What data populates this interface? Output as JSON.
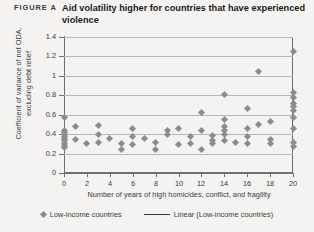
{
  "header": {
    "figure_tag": "FIGURE A",
    "title": "Aid volatility higher for countries that have experienced violence"
  },
  "legend": {
    "scatter_label": "Low-income countries",
    "scatter_marker": "diamond-marker-icon",
    "line_label": "Linear (Low-income countries)",
    "line_marker": "trend-line-icon"
  },
  "colors": {
    "marker": "#8d8b90",
    "trendline": "#3a3a3a",
    "grid": "#b9b7b4",
    "axis": "#6f6f6f",
    "background": "#f4f3f1"
  },
  "chart_data": {
    "type": "scatter",
    "title": "Aid volatility higher for countries that have experienced violence",
    "xlabel": "Number of years of high homicides, conflict, and fragility",
    "ylabel": "Coefficient of variance of net ODA, excluding debt relief",
    "xlim": [
      0,
      20
    ],
    "ylim": [
      0,
      1.4
    ],
    "xticks": [
      0,
      2,
      4,
      6,
      8,
      10,
      12,
      14,
      16,
      18,
      20
    ],
    "xtick_labels": [
      "0",
      "2",
      "4",
      "6",
      "8",
      "10",
      "12",
      "14",
      "16",
      "18",
      "20"
    ],
    "yticks": [
      0,
      0.2,
      0.4,
      0.6,
      0.8,
      1,
      1.2,
      1.4
    ],
    "ytick_labels": [
      "0",
      "0.2",
      "0.4",
      "0.6",
      "0.8",
      "1",
      "1.2",
      "1.4"
    ],
    "grid": "horizontal",
    "legend_position": "bottom",
    "series": [
      {
        "name": "Low-income countries",
        "type": "scatter",
        "marker": "diamond",
        "points": [
          [
            0,
            0.57
          ],
          [
            0,
            0.44
          ],
          [
            0,
            0.42
          ],
          [
            0,
            0.4
          ],
          [
            0,
            0.38
          ],
          [
            0,
            0.36
          ],
          [
            0,
            0.33
          ],
          [
            0,
            0.3
          ],
          [
            0,
            0.28
          ],
          [
            0,
            0.26
          ],
          [
            1,
            0.48
          ],
          [
            1,
            0.35
          ],
          [
            2,
            0.3
          ],
          [
            3,
            0.49
          ],
          [
            3,
            0.4
          ],
          [
            3,
            0.31
          ],
          [
            4,
            0.36
          ],
          [
            5,
            0.3
          ],
          [
            5,
            0.24
          ],
          [
            6,
            0.46
          ],
          [
            6,
            0.38
          ],
          [
            6,
            0.29
          ],
          [
            7,
            0.36
          ],
          [
            8,
            0.31
          ],
          [
            8,
            0.24
          ],
          [
            9,
            0.44
          ],
          [
            9,
            0.4
          ],
          [
            10,
            0.46
          ],
          [
            10,
            0.29
          ],
          [
            11,
            0.38
          ],
          [
            11,
            0.3
          ],
          [
            12,
            0.62
          ],
          [
            12,
            0.44
          ],
          [
            12,
            0.24
          ],
          [
            13,
            0.39
          ],
          [
            13,
            0.34
          ],
          [
            13,
            0.3
          ],
          [
            14,
            0.81
          ],
          [
            14,
            0.55
          ],
          [
            14,
            0.48
          ],
          [
            14,
            0.44
          ],
          [
            14,
            0.4
          ],
          [
            14,
            0.33
          ],
          [
            15,
            0.31
          ],
          [
            16,
            0.66
          ],
          [
            16,
            0.46
          ],
          [
            16,
            0.38
          ],
          [
            16,
            0.3
          ],
          [
            17,
            1.05
          ],
          [
            17,
            0.5
          ],
          [
            18,
            0.53
          ],
          [
            18,
            0.35
          ],
          [
            18,
            0.3
          ],
          [
            20,
            1.25
          ],
          [
            20,
            0.83
          ],
          [
            20,
            0.78
          ],
          [
            20,
            0.72
          ],
          [
            20,
            0.68
          ],
          [
            20,
            0.64
          ],
          [
            20,
            0.57
          ],
          [
            20,
            0.46
          ],
          [
            20,
            0.31
          ],
          [
            20,
            0.27
          ]
        ]
      },
      {
        "name": "Linear (Low-income countries)",
        "type": "line",
        "fit": "linear",
        "endpoints": [
          [
            0,
            0.33
          ],
          [
            20,
            0.575
          ]
        ]
      }
    ]
  }
}
